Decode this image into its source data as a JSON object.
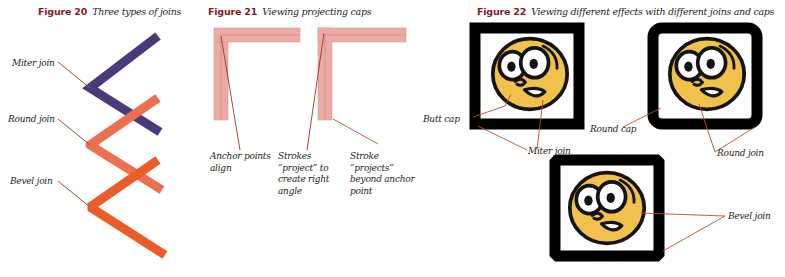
{
  "figures": [
    {
      "id": "figure-20",
      "number": "Figure 20",
      "title": "Three types of joins",
      "annotations": [
        {
          "id": "miter-join",
          "label": "Miter join"
        },
        {
          "id": "round-join",
          "label": "Round join"
        },
        {
          "id": "bevel-join",
          "label": "Bevel join"
        }
      ],
      "strokes": [
        {
          "name": "miter-stroke",
          "join": "miter",
          "color": "#4a3a7a"
        },
        {
          "name": "round-stroke",
          "join": "round",
          "color": "#ec7050"
        },
        {
          "name": "bevel-stroke",
          "join": "bevel",
          "color": "#ea5c28"
        }
      ]
    },
    {
      "id": "figure-21",
      "number": "Figure 21",
      "title": "Viewing projecting caps",
      "annotations": [
        {
          "id": "anchor-points-align",
          "label": "Anchor points align"
        },
        {
          "id": "strokes-project-right-angle",
          "label": "Strokes “project” to create right angle"
        },
        {
          "id": "stroke-projects-beyond-anchor",
          "label": "Stroke “projects” beyond anchor point"
        }
      ],
      "shapes": [
        {
          "name": "butt-cap-corner",
          "cap": "butt",
          "color": "#edaaa4"
        },
        {
          "name": "projecting-cap-corner",
          "cap": "projecting",
          "color": "#edaaa4"
        }
      ]
    },
    {
      "id": "figure-22",
      "number": "Figure 22",
      "title": "Viewing different effects with different joins and caps",
      "annotations": [
        {
          "id": "butt-cap",
          "label": "Butt cap"
        },
        {
          "id": "miter-join",
          "label": "Miter join"
        },
        {
          "id": "round-cap",
          "label": "Round cap"
        },
        {
          "id": "round-join",
          "label": "Round join"
        },
        {
          "id": "bevel-join",
          "label": "Bevel join"
        }
      ],
      "frames": [
        {
          "name": "frame-miter-butt",
          "join": "miter",
          "cap": "butt"
        },
        {
          "name": "frame-round-round",
          "join": "round",
          "cap": "round"
        },
        {
          "name": "frame-bevel",
          "join": "bevel",
          "cap": "butt"
        }
      ],
      "face": {
        "skin_color": "#f0c14b",
        "outline_color": "#1a1a1a",
        "eye_white": "#ffffff",
        "pupil_color": "#1a1a1a"
      }
    }
  ],
  "colors": {
    "caption_number": "#8c1a1a",
    "caption_title": "#231f20",
    "leader_line": "#a0522d",
    "miter_purple": "#4a3a7a",
    "round_coral": "#ec7050",
    "bevel_orange": "#ea5c28",
    "cap_pink": "#edaaa4",
    "cap_pink_edge": "#e09a95",
    "frame_black": "#000000",
    "background": "#ffffff"
  }
}
